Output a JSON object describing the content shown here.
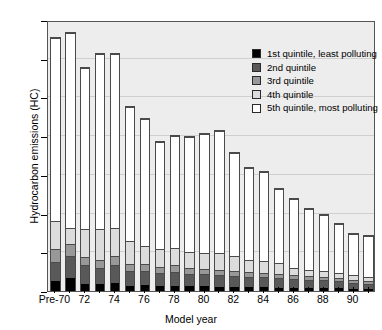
{
  "chart_data": {
    "type": "bar",
    "subtype": "stacked-bar",
    "title": "",
    "xlabel": "Model year",
    "ylabel": "Hydrocarbon emissions (HC)",
    "ylim": [
      0.0,
      0.7
    ],
    "ytick_labels": [
      "0.0",
      "0.1",
      "0.2",
      "0.3",
      "0.4",
      "0.5",
      "0.6",
      "0.7"
    ],
    "ytick_values": [
      0.0,
      0.1,
      0.2,
      0.3,
      0.4,
      0.5,
      0.6,
      0.7
    ],
    "grid": true,
    "grid_axis": "y",
    "legend_position": "top-right-inside",
    "categories": [
      "Pre-70",
      "71",
      "72",
      "73",
      "74",
      "75",
      "76",
      "77",
      "78",
      "79",
      "80",
      "81",
      "82",
      "83",
      "84",
      "85",
      "86",
      "87",
      "88",
      "89",
      "90",
      "91"
    ],
    "xtick_labels": [
      "Pre-70",
      "",
      "72",
      "",
      "74",
      "",
      "76",
      "",
      "78",
      "",
      "80",
      "",
      "82",
      "",
      "84",
      "",
      "86",
      "",
      "88",
      "",
      "90",
      ""
    ],
    "series": [
      {
        "name": "1st quintile, least polluting",
        "color": "#000000",
        "values": [
          0.025,
          0.033,
          0.019,
          0.018,
          0.021,
          0.014,
          0.015,
          0.013,
          0.014,
          0.012,
          0.012,
          0.011,
          0.011,
          0.01,
          0.01,
          0.009,
          0.009,
          0.008,
          0.008,
          0.007,
          0.006,
          0.005
        ]
      },
      {
        "name": "2nd quintile",
        "color": "#595959",
        "values": [
          0.049,
          0.057,
          0.048,
          0.043,
          0.047,
          0.038,
          0.037,
          0.034,
          0.036,
          0.032,
          0.031,
          0.03,
          0.029,
          0.027,
          0.026,
          0.024,
          0.023,
          0.021,
          0.02,
          0.018,
          0.016,
          0.014
        ]
      },
      {
        "name": "3rd quintile",
        "color": "#989898",
        "values": [
          0.034,
          0.032,
          0.022,
          0.02,
          0.022,
          0.018,
          0.017,
          0.016,
          0.017,
          0.015,
          0.015,
          0.014,
          0.013,
          0.012,
          0.012,
          0.011,
          0.01,
          0.01,
          0.009,
          0.008,
          0.008,
          0.007
        ]
      },
      {
        "name": "4th quintile",
        "color": "#dcdcdc",
        "values": [
          0.074,
          0.041,
          0.073,
          0.08,
          0.073,
          0.06,
          0.048,
          0.045,
          0.046,
          0.042,
          0.04,
          0.045,
          0.038,
          0.033,
          0.031,
          0.028,
          0.018,
          0.016,
          0.016,
          0.014,
          0.011,
          0.01
        ]
      },
      {
        "name": "5th quintile, most polluting",
        "color": "#ffffff",
        "values": [
          0.473,
          0.507,
          0.416,
          0.454,
          0.452,
          0.348,
          0.331,
          0.28,
          0.289,
          0.299,
          0.309,
          0.315,
          0.269,
          0.238,
          0.23,
          0.193,
          0.18,
          0.16,
          0.147,
          0.128,
          0.109,
          0.108
        ]
      }
    ],
    "bar_totals": [
      0.655,
      0.67,
      0.578,
      0.615,
      0.615,
      0.478,
      0.448,
      0.388,
      0.402,
      0.4,
      0.407,
      0.415,
      0.36,
      0.32,
      0.309,
      0.265,
      0.24,
      0.215,
      0.2,
      0.175,
      0.15,
      0.144
    ]
  },
  "legend": {
    "entries": [
      {
        "label": "1st quintile, least polluting",
        "color": "#000000"
      },
      {
        "label": "2nd quintile",
        "color": "#595959"
      },
      {
        "label": "3rd quintile",
        "color": "#989898"
      },
      {
        "label": "4th quintile",
        "color": "#dcdcdc"
      },
      {
        "label": "5th quintile, most polluting",
        "color": "#ffffff"
      }
    ]
  },
  "colors": {
    "plot_background": "#ededed",
    "axis": "#555555",
    "gridline": "#cfcfcf",
    "bar_outline": "#4a4a4a",
    "page_background": "#ffffff"
  }
}
